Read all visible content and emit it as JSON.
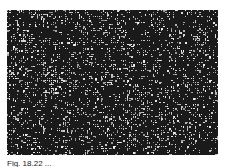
{
  "figure": {
    "kind": "grainy monochrome micrograph",
    "colors": {
      "dark": "#1a1a1a",
      "light": "#f2f2f2"
    }
  },
  "caption": {
    "text": "Fig. 18.22 ..."
  }
}
